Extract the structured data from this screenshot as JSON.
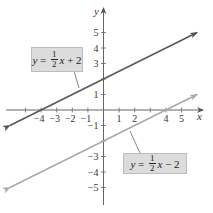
{
  "chart_data": {
    "type": "line",
    "title": "",
    "xlabel": "x",
    "ylabel": "y",
    "xlim": [
      -6,
      6
    ],
    "ylim": [
      -6,
      6
    ],
    "grid": false,
    "x_ticks": [
      -5,
      -4,
      -3,
      -2,
      -1,
      1,
      2,
      3,
      4,
      5
    ],
    "x_tick_labels": [
      "-4",
      "-3",
      "-2",
      "-1",
      "1",
      "2",
      "4",
      "5"
    ],
    "y_ticks": [
      -5,
      -4,
      -3,
      -2,
      -1,
      1,
      2,
      3,
      4,
      5
    ],
    "y_tick_labels": [
      "5",
      "4",
      "3",
      "1",
      "-1",
      "-3",
      "-4",
      "-5"
    ],
    "series": [
      {
        "name": "y = 1/2 x + 2",
        "slope": 0.5,
        "intercept": 2,
        "x": [
          -6,
          6
        ],
        "y": [
          -1,
          5
        ],
        "color": "#555555"
      },
      {
        "name": "y = 1/2 x - 2",
        "slope": 0.5,
        "intercept": -2,
        "x": [
          -6,
          6
        ],
        "y": [
          -5,
          1
        ],
        "color": "#a8a8a8"
      }
    ],
    "annotations": [
      {
        "text": "y = 1/2 x + 2",
        "points_to_series": 0
      },
      {
        "text": "y = 1/2 x - 2",
        "points_to_series": 1
      }
    ]
  },
  "axes": {
    "x_name": "x",
    "y_name": "y",
    "x_labels": [
      {
        "v": -4,
        "t": "−4"
      },
      {
        "v": -3,
        "t": "−3"
      },
      {
        "v": -2,
        "t": "−2"
      },
      {
        "v": -1,
        "t": "−1"
      },
      {
        "v": 1,
        "t": "1"
      },
      {
        "v": 2,
        "t": "2"
      },
      {
        "v": 4,
        "t": "4"
      },
      {
        "v": 5,
        "t": "5"
      }
    ],
    "y_labels": [
      {
        "v": 5,
        "t": "5"
      },
      {
        "v": 4,
        "t": "4"
      },
      {
        "v": 3,
        "t": "3"
      },
      {
        "v": 1,
        "t": "1"
      },
      {
        "v": -1,
        "t": "−1"
      },
      {
        "v": -3,
        "t": "−3"
      },
      {
        "v": -4,
        "t": "−4"
      },
      {
        "v": -5,
        "t": "−5"
      }
    ]
  },
  "labels": {
    "line1": {
      "lhs": "y",
      "eq": " = ",
      "num": "1",
      "den": "2",
      "var": "x",
      "rest": " + 2"
    },
    "line2": {
      "lhs": "y",
      "eq": " = ",
      "num": "1",
      "den": "2",
      "var": "x",
      "rest": " − 2"
    }
  },
  "colors": {
    "line1": "#555555",
    "line2": "#a8a8a8",
    "axis": "#555555",
    "box": "#dcdcdc"
  }
}
